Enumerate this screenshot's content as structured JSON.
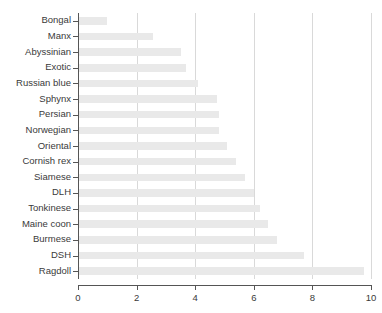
{
  "chart_data": {
    "type": "bar",
    "orientation": "horizontal",
    "title": "",
    "subtitle": "",
    "xlabel": "",
    "ylabel": "",
    "xlim": [
      0,
      10
    ],
    "ylim": null,
    "grid": "vertical",
    "legend": null,
    "xticks": [
      "0",
      "2",
      "4",
      "6",
      "8",
      "10"
    ],
    "xtick_values": [
      0,
      2,
      4,
      6,
      8,
      10
    ],
    "categories": [
      "Bongal",
      "Manx",
      "Abyssinian",
      "Exotic",
      "Russian blue",
      "Sphynx",
      "Persian",
      "Norwegian",
      "Oriental",
      "Cornish rex",
      "Siamese",
      "DLH",
      "Tonkinese",
      "Maine coon",
      "Burmese",
      "DSH",
      "Ragdoll"
    ],
    "values": [
      1.0,
      2.55,
      3.5,
      3.7,
      4.1,
      4.75,
      4.8,
      4.8,
      5.1,
      5.4,
      5.7,
      6.0,
      6.2,
      6.5,
      6.8,
      7.7,
      9.75
    ],
    "bar_color": "#e9e9e9",
    "gridline_color": "#d9d9d9",
    "axis_color": "#555555",
    "text_color": "#3a3a3a",
    "background_color": "#ffffff"
  }
}
